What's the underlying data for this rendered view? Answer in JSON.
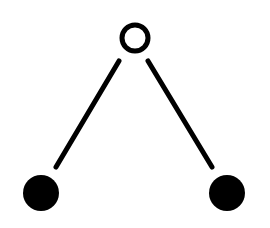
{
  "diagram": {
    "type": "tree",
    "colors": {
      "background": "#ffffff",
      "stroke": "#000000",
      "fill": "#000000"
    },
    "nodes": [
      {
        "id": "root",
        "cx": 135,
        "cy": 38,
        "r": 13,
        "style": "hollow"
      },
      {
        "id": "left-leaf",
        "cx": 41,
        "cy": 193,
        "r": 18,
        "style": "filled"
      },
      {
        "id": "right-leaf",
        "cx": 227,
        "cy": 193,
        "r": 18,
        "style": "filled"
      }
    ],
    "edges": [
      {
        "from": "root",
        "to": "left-leaf",
        "x1": 119,
        "y1": 61,
        "x2": 56,
        "y2": 167
      },
      {
        "from": "root",
        "to": "right-leaf",
        "x1": 148,
        "y1": 61,
        "x2": 212,
        "y2": 167
      }
    ],
    "stroke_width": 5
  }
}
